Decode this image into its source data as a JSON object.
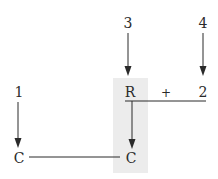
{
  "diagram": {
    "type": "reaction-scheme",
    "colors": {
      "ink": "#2a2a2a",
      "highlight": "#ececec",
      "background": "#ffffff"
    },
    "numbers": {
      "n1": "1",
      "n3": "3",
      "n4": "4"
    },
    "reactants": {
      "r": "R",
      "plus": "+",
      "two": "2"
    },
    "products": {
      "c_left": "C",
      "c_right": "C"
    }
  }
}
